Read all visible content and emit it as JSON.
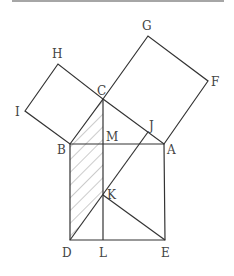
{
  "diagram": {
    "points": {
      "A": {
        "x": 164,
        "y": 144,
        "label": "A"
      },
      "B": {
        "x": 70,
        "y": 144,
        "label": "B"
      },
      "C": {
        "x": 103,
        "y": 99,
        "label": "C"
      },
      "D": {
        "x": 70,
        "y": 240,
        "label": "D"
      },
      "E": {
        "x": 165,
        "y": 240,
        "label": "E"
      },
      "F": {
        "x": 208,
        "y": 81,
        "label": "F"
      },
      "G": {
        "x": 148,
        "y": 36,
        "label": "G"
      },
      "H": {
        "x": 58,
        "y": 64,
        "label": "H"
      },
      "I": {
        "x": 25,
        "y": 111,
        "label": "I"
      },
      "J": {
        "x": 148,
        "y": 132,
        "label": "J"
      },
      "K": {
        "x": 103,
        "y": 195,
        "label": "K"
      },
      "L": {
        "x": 103,
        "y": 240,
        "label": "L"
      },
      "M": {
        "x": 103,
        "y": 144,
        "label": "M"
      }
    },
    "labels": {
      "A": "A",
      "B": "B",
      "C": "C",
      "D": "D",
      "E": "E",
      "F": "F",
      "G": "G",
      "H": "H",
      "I": "I",
      "J": "J",
      "K": "K",
      "L": "L",
      "M": "M"
    },
    "shaded_region": "B-C-M-K-D (hatched)",
    "colors": {
      "line": "#333333",
      "hatch": "#999999",
      "label": "#444444",
      "top_rule": "#888888"
    }
  }
}
